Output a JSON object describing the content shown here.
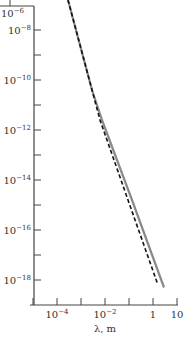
{
  "chart_data": {
    "type": "line",
    "title": "",
    "xlabel": "λ, m",
    "ylabel": "",
    "xscale": "log",
    "yscale": "log",
    "xlim_log10": [
      -5,
      1
    ],
    "ylim_log10": [
      -19,
      -6.8
    ],
    "grid": false,
    "legend": null,
    "x_ticks": [
      {
        "log10": -5,
        "label": ""
      },
      {
        "log10": -4,
        "label": "10",
        "exp": "−4"
      },
      {
        "log10": -3,
        "label": ""
      },
      {
        "log10": -2,
        "label": "10",
        "exp": "−2"
      },
      {
        "log10": -1,
        "label": ""
      },
      {
        "log10": 0,
        "label": "1",
        "exp": ""
      },
      {
        "log10": 1,
        "label": "10",
        "exp": ""
      }
    ],
    "y_ticks": [
      {
        "log10": -8,
        "label": "10",
        "exp": "−8"
      },
      {
        "log10": -9,
        "label": ""
      },
      {
        "log10": -10,
        "label": "10",
        "exp": "−10"
      },
      {
        "log10": -11,
        "label": ""
      },
      {
        "log10": -12,
        "label": "10",
        "exp": "−12"
      },
      {
        "log10": -13,
        "label": ""
      },
      {
        "log10": -14,
        "label": "10",
        "exp": "−14"
      },
      {
        "log10": -15,
        "label": ""
      },
      {
        "log10": -16,
        "label": "10",
        "exp": "−16"
      },
      {
        "log10": -17,
        "label": ""
      },
      {
        "log10": -18,
        "label": "10",
        "exp": "−18"
      }
    ],
    "corner_label": {
      "label": "10",
      "exp": "−6"
    },
    "series": [
      {
        "name": "solid-gray",
        "style": "solid",
        "color": "#8a8a8a",
        "x_log10": [
          -3.54,
          -3.21,
          -2.875,
          -2.54,
          -2.125,
          -0.875,
          0.46
        ],
        "y_log10": [
          -6.8,
          -8.0,
          -9.2,
          -10.4,
          -11.6,
          -14.8,
          -18.3
        ]
      },
      {
        "name": "dashed-black",
        "style": "dashed",
        "color": "#111111",
        "x_log10": [
          -3.54,
          -3.21,
          -2.875,
          -2.54,
          -2.21,
          -1.04,
          0.17
        ],
        "y_log10": [
          -6.8,
          -8.0,
          -9.2,
          -10.4,
          -11.6,
          -14.8,
          -18.1
        ]
      }
    ]
  }
}
